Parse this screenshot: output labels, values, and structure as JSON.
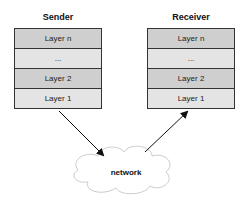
{
  "sender": {
    "title": "Sender",
    "layers": [
      "Layer n",
      "...",
      "Layer 2",
      "Layer 1"
    ]
  },
  "receiver": {
    "title": "Receiver",
    "layers": [
      "Layer n",
      "...",
      "Layer 2",
      "Layer 1"
    ]
  },
  "network": {
    "label": "network"
  }
}
